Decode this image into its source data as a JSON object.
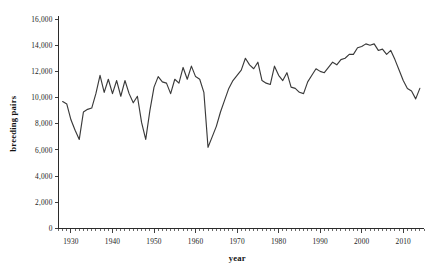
{
  "chart_data": {
    "type": "line",
    "title": "",
    "xlabel": "year",
    "ylabel": "breeding pairs",
    "xlim": [
      1927,
      2015
    ],
    "ylim": [
      0,
      16000
    ],
    "grid": false,
    "legend": null,
    "y_ticks": [
      0,
      2000,
      4000,
      6000,
      8000,
      10000,
      12000,
      14000,
      16000
    ],
    "y_tick_labels": [
      "0",
      "2,000",
      "4,000",
      "6,000",
      "8,000",
      "10,000",
      "12,000",
      "14,000",
      "16,000"
    ],
    "x_ticks": [
      1930,
      1940,
      1950,
      1960,
      1970,
      1980,
      1990,
      2000,
      2010
    ],
    "x_tick_labels": [
      "1930",
      "1940",
      "1950",
      "1960",
      "1970",
      "1980",
      "1990",
      "2000",
      "2010"
    ],
    "x_minor_tick_interval": 1,
    "series": [
      {
        "name": "breeding pairs",
        "color": "#3a3a3a",
        "x": [
          1928,
          1929,
          1930,
          1931,
          1932,
          1933,
          1934,
          1935,
          1936,
          1937,
          1938,
          1939,
          1940,
          1941,
          1942,
          1943,
          1944,
          1945,
          1946,
          1947,
          1948,
          1949,
          1950,
          1951,
          1952,
          1953,
          1954,
          1955,
          1956,
          1957,
          1958,
          1959,
          1960,
          1961,
          1962,
          1963,
          1964,
          1965,
          1966,
          1967,
          1968,
          1969,
          1970,
          1971,
          1972,
          1973,
          1974,
          1975,
          1976,
          1977,
          1978,
          1979,
          1980,
          1981,
          1982,
          1983,
          1984,
          1985,
          1986,
          1987,
          1988,
          1989,
          1990,
          1991,
          1992,
          1993,
          1994,
          1995,
          1996,
          1997,
          1998,
          1999,
          2000,
          2001,
          2002,
          2003,
          2004,
          2005,
          2006,
          2007,
          2008,
          2009,
          2010,
          2011,
          2012,
          2013,
          2014
        ],
        "y": [
          9700,
          9500,
          8300,
          7500,
          6800,
          8900,
          9100,
          9200,
          10300,
          11700,
          10400,
          11400,
          10300,
          11300,
          10100,
          11300,
          10300,
          9600,
          10100,
          8100,
          6800,
          9000,
          10800,
          11600,
          11200,
          11100,
          10300,
          11400,
          11100,
          12300,
          11400,
          12400,
          11600,
          11400,
          10400,
          6200,
          7000,
          7800,
          8900,
          9800,
          10700,
          11300,
          11700,
          12100,
          13000,
          12500,
          12200,
          12700,
          11300,
          11100,
          11000,
          12400,
          11700,
          11300,
          11900,
          10800,
          10700,
          10400,
          10300,
          11200,
          11700,
          12200,
          12000,
          11900,
          12300,
          12700,
          12500,
          12900,
          13000,
          13300,
          13300,
          13800,
          13900,
          14100,
          14000,
          14100,
          13600,
          13700,
          13300,
          13600,
          12900,
          12100,
          11300,
          10700,
          10500,
          9900,
          10700
        ]
      }
    ]
  },
  "axis_titles": {
    "y": "breeding pairs",
    "x": "year"
  }
}
